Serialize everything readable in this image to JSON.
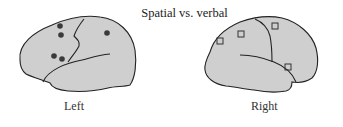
{
  "title": "Spatial vs. verbal",
  "colors": {
    "brain_fill": "#cfcfcf",
    "outline": "#222222",
    "marker": "#3a3a3a",
    "background": "#ffffff"
  },
  "hemispheres": [
    {
      "label": "Left",
      "marker_type": "filled-circle",
      "markers": [
        {
          "x": 60,
          "y": 26
        },
        {
          "x": 61,
          "y": 35
        },
        {
          "x": 54,
          "y": 56
        },
        {
          "x": 62,
          "y": 59
        },
        {
          "x": 107,
          "y": 33
        }
      ]
    },
    {
      "label": "Right",
      "marker_type": "open-square",
      "markers": [
        {
          "x": 220,
          "y": 41
        },
        {
          "x": 241,
          "y": 34
        },
        {
          "x": 275,
          "y": 26
        },
        {
          "x": 288,
          "y": 67
        }
      ]
    }
  ]
}
